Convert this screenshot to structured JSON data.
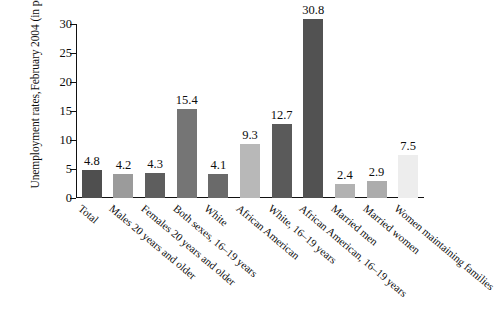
{
  "chart_data": {
    "type": "bar",
    "title": "",
    "xlabel": "",
    "ylabel": "Unemployment rates, February 2004 (in percent)",
    "ylabel_lines": [
      "Unemployment rates,",
      "February 2004 (in percent)"
    ],
    "ylim": [
      0,
      30
    ],
    "yticks": [
      0,
      5,
      10,
      15,
      20,
      25,
      30
    ],
    "ytick_labels": [
      "0",
      "5",
      "10",
      "15",
      "20",
      "25",
      "30"
    ],
    "grid": false,
    "legend": null,
    "categories": [
      "Total",
      "Males 20 years and older",
      "Females 20 years and older",
      "Both sexes, 16–19 years",
      "White",
      "African American",
      "White, 16–19 years",
      "African American, 16–19 years",
      "Married men",
      "Married women",
      "Women maintaining families"
    ],
    "values": [
      4.8,
      4.2,
      4.3,
      15.4,
      4.1,
      9.3,
      12.7,
      30.8,
      2.4,
      2.9,
      7.5
    ],
    "value_labels": [
      "4.8",
      "4.2",
      "4.3",
      "15.4",
      "4.1",
      "9.3",
      "12.7",
      "30.8",
      "2.4",
      "2.9",
      "7.5"
    ],
    "bar_colors": [
      "#4f4f4f",
      "#9b9b9b",
      "#5e5e5e",
      "#757575",
      "#6a6a6a",
      "#b8b8b8",
      "#5a5a5a",
      "#525252",
      "#b2b2b2",
      "#acacac",
      "#ededed"
    ],
    "axis_color": "#111111"
  }
}
